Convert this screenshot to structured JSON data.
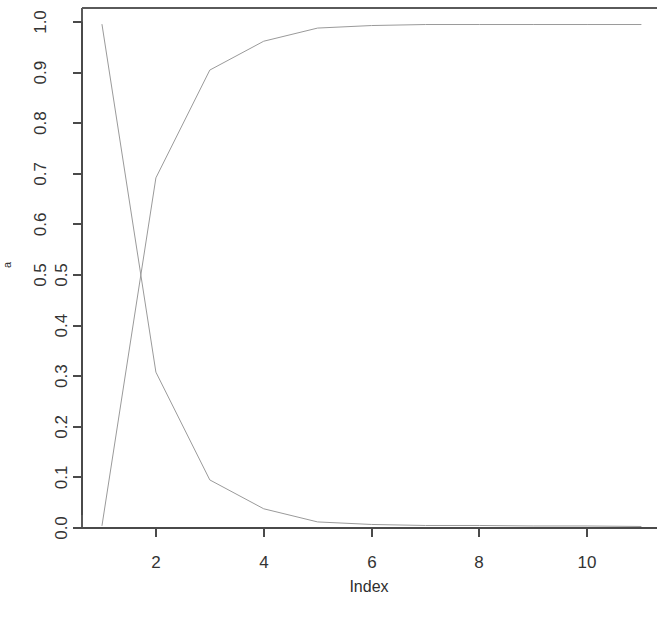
{
  "chart_data": {
    "type": "line",
    "title": "",
    "subtitle": "",
    "xlabel": "Index",
    "ylabel": "a",
    "xlim": [
      1,
      11
    ],
    "ylim": [
      0.0,
      1.0
    ],
    "grid": false,
    "legend": null,
    "legend_position": "none",
    "x": [
      1,
      2,
      3,
      4,
      5,
      6,
      7,
      8,
      9,
      10,
      11
    ],
    "x_ticks": [
      2,
      4,
      6,
      8,
      10
    ],
    "x_tick_labels": [
      "2",
      "4",
      "6",
      "8",
      "10"
    ],
    "y_ticks_upper": [
      1.0,
      0.9,
      0.8,
      0.7,
      0.6,
      0.5
    ],
    "y_tick_labels_upper": [
      "1.0",
      "0.9",
      "0.8",
      "0.7",
      "0.6",
      "0.5"
    ],
    "y_ticks_lower": [
      0.5,
      0.4,
      0.3,
      0.2,
      0.1,
      0.0
    ],
    "y_tick_labels_lower": [
      "0.5",
      "0.4",
      "0.3",
      "0.2",
      "0.1",
      "0.0"
    ],
    "series": [
      {
        "name": "rising",
        "values": [
          0.005,
          0.692,
          0.905,
          0.962,
          0.988,
          0.993,
          0.995,
          0.995,
          0.995,
          0.995,
          0.995
        ]
      },
      {
        "name": "falling",
        "values": [
          0.995,
          0.308,
          0.095,
          0.038,
          0.012,
          0.007,
          0.005,
          0.005,
          0.004,
          0.004,
          0.003
        ]
      }
    ]
  },
  "figure": {
    "background_color": "#ffffff",
    "line_color": "#9a9a9a",
    "axis_color": "#4a4a4a",
    "text_color": "#333333"
  }
}
